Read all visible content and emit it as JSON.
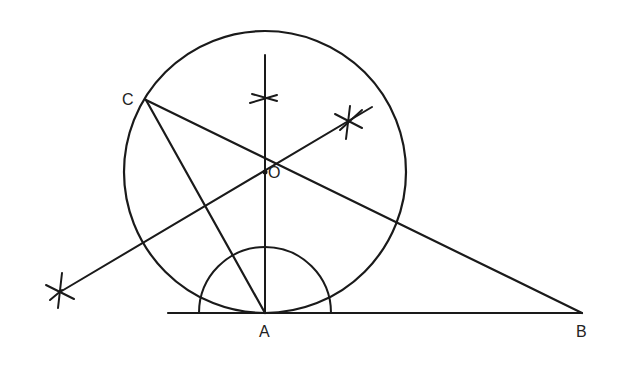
{
  "diagram": {
    "type": "geometric-construction",
    "colors": {
      "ink": "#1a1a1a",
      "background": "#ffffff"
    },
    "points": {
      "A": {
        "label": "A",
        "x": 265,
        "y": 313
      },
      "B": {
        "label": "B",
        "x": 582,
        "y": 313
      },
      "C": {
        "label": "C",
        "x": 146,
        "y": 100
      },
      "O": {
        "label": "O",
        "x": 265,
        "y": 172
      }
    },
    "circle": {
      "cx": 265,
      "cy": 172,
      "r": 141
    },
    "construction_arc": {
      "center": "A",
      "r": 66
    },
    "baseline": {
      "x1": 168,
      "x2": 582,
      "y": 313
    },
    "perpendicular_at_A": {
      "x": 265,
      "y_top": 55,
      "y_bottom": 313
    },
    "bisector": {
      "x1": 60,
      "y1": 292,
      "x2": 372,
      "y2": 107
    },
    "segments": [
      {
        "from": "C",
        "to": "A"
      },
      {
        "from": "C",
        "to": "B"
      }
    ],
    "arc_marks": [
      {
        "name": "perp-mark",
        "x": 265,
        "y": 98
      },
      {
        "name": "bisector-mark-upper",
        "x": 347,
        "y": 121
      },
      {
        "name": "bisector-mark-lower",
        "x": 60,
        "y": 292
      }
    ]
  }
}
